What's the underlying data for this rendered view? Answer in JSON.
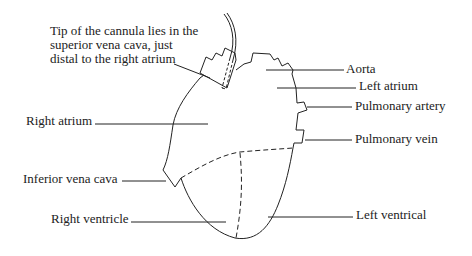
{
  "diagram": {
    "callout": {
      "lines": [
        "Tip of the cannula lies in the",
        "superior vena cava, just",
        "distal to the right atrium"
      ]
    },
    "labels": {
      "aorta": "Aorta",
      "left_atrium": "Left atrium",
      "pulmonary_artery": "Pulmonary artery",
      "pulmonary_vein": "Pulmonary vein",
      "right_atrium": "Right atrium",
      "inferior_vena_cava": "Inferior vena cava",
      "right_ventricle": "Right ventricle",
      "left_ventrical": "Left ventrical"
    },
    "colors": {
      "stroke": "#222222",
      "text": "#222222",
      "background": "#ffffff"
    }
  }
}
